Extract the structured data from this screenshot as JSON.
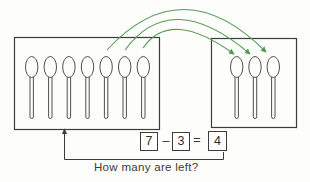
{
  "diagram": {
    "kind": "subtraction-take-away-diagram",
    "question": "How many are left?",
    "equation": {
      "minuend": "7",
      "operator": "–",
      "subtrahend": "3",
      "equals_sign": "=",
      "result": "4"
    },
    "groups": {
      "left_box_spoon_count": 7,
      "right_box_spoon_count": 3,
      "arrows_moved_count": 3
    },
    "icons": {
      "item": "spoon-icon",
      "arrow": "curved-arrow-icon"
    },
    "colors": {
      "arrow_green": "#579b58",
      "arrow_head_green": "#4f9a52",
      "box_line": "#3c3c3c",
      "spoon_outline": "#4f4f4f",
      "text": "#3a3a3a"
    }
  }
}
